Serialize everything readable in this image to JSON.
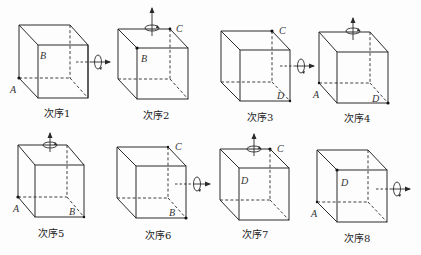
{
  "figure": {
    "cubes": [
      {
        "caption": "次序1",
        "labels": {
          "A": "A",
          "B": "B"
        },
        "axis": "horizontal",
        "marked_vertices": [
          "A"
        ]
      },
      {
        "caption": "次序2",
        "labels": {
          "B": "B",
          "C": "C"
        },
        "axis": "vertical",
        "marked_vertices": [
          "B",
          "C"
        ]
      },
      {
        "caption": "次序3",
        "labels": {
          "C": "C",
          "D": "D"
        },
        "axis": "horizontal",
        "marked_vertices": [
          "C",
          "D"
        ]
      },
      {
        "caption": "次序4",
        "labels": {
          "A": "A",
          "D": "D"
        },
        "axis": "vertical",
        "marked_vertices": [
          "A",
          "D"
        ]
      },
      {
        "caption": "次序5",
        "labels": {
          "A": "A",
          "B": "B"
        },
        "axis": "vertical",
        "marked_vertices": [
          "A",
          "B"
        ]
      },
      {
        "caption": "次序6",
        "labels": {
          "B": "B",
          "C": "C"
        },
        "axis": "horizontal",
        "marked_vertices": [
          "B",
          "C"
        ]
      },
      {
        "caption": "次序7",
        "labels": {
          "C": "C",
          "D": "D"
        },
        "axis": "vertical",
        "marked_vertices": [
          "C"
        ]
      },
      {
        "caption": "次序8",
        "labels": {
          "A": "A",
          "D": "D"
        },
        "axis": "horizontal",
        "marked_vertices": [
          "A",
          "D"
        ]
      }
    ]
  }
}
